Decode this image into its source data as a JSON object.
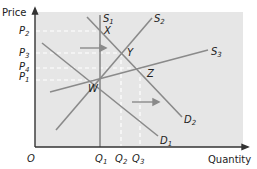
{
  "diagram": {
    "type": "supply-demand",
    "axes": {
      "y_label": "Price",
      "x_label": "Quantity",
      "origin_label": "O"
    },
    "price_levels": [
      {
        "id": "P2",
        "letter": "P",
        "sub": "2",
        "y": 31
      },
      {
        "id": "P3",
        "letter": "P",
        "sub": "3",
        "y": 53
      },
      {
        "id": "P4",
        "letter": "P",
        "sub": "4",
        "y": 68
      },
      {
        "id": "P1",
        "letter": "P",
        "sub": "1",
        "y": 80
      }
    ],
    "quantity_levels": [
      {
        "id": "Q1",
        "letter": "Q",
        "sub": "1",
        "x": 100
      },
      {
        "id": "Q2",
        "letter": "Q",
        "sub": "2",
        "x": 121
      },
      {
        "id": "Q3",
        "letter": "Q",
        "sub": "3",
        "x": 140
      }
    ],
    "curves": [
      {
        "id": "S1",
        "letter": "S",
        "sub": "1",
        "kind": "supply"
      },
      {
        "id": "S2",
        "letter": "S",
        "sub": "2",
        "kind": "supply"
      },
      {
        "id": "S3",
        "letter": "S",
        "sub": "3",
        "kind": "supply"
      },
      {
        "id": "D1",
        "letter": "D",
        "sub": "1",
        "kind": "demand"
      },
      {
        "id": "D2",
        "letter": "D",
        "sub": "2",
        "kind": "demand"
      }
    ],
    "points": [
      {
        "id": "X",
        "label": "X"
      },
      {
        "id": "Y",
        "label": "Y"
      },
      {
        "id": "Z",
        "label": "Z"
      },
      {
        "id": "W",
        "label": "W"
      }
    ],
    "arrows": [
      {
        "id": "demand-shift-arrow-upper",
        "direction": "right"
      },
      {
        "id": "demand-shift-arrow-lower",
        "direction": "right"
      }
    ],
    "colors": {
      "plot_bg": "#e6e6e6",
      "curve": "#8a8a8a",
      "axis": "#333333",
      "dash": "#ffffff",
      "text": "#222222"
    }
  }
}
